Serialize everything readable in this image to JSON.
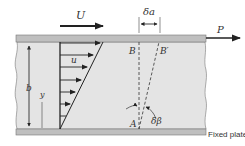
{
  "labels": {
    "top_velocity": "U",
    "force": "P",
    "delta_a": "δa",
    "point_B": "B",
    "point_B_prime": "B′",
    "point_A": "A",
    "delta_beta": "δβ",
    "velocity_u": "u",
    "gap_b": "b",
    "height_y": "y",
    "fixed_plate": "Fixed plate"
  },
  "colors": {
    "fluid": "#e4e4e4",
    "plate": "#bfbfbf",
    "ink": "#222222",
    "text": "#333333"
  }
}
